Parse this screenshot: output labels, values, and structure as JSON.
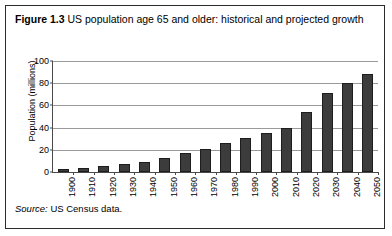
{
  "figure": {
    "label": "Figure 1.3",
    "title": "US population age 65 and older: historical and projected growth",
    "source_word": "Source:",
    "source_text": "US Census data."
  },
  "chart_data": {
    "type": "bar",
    "title": "US population age 65 and older: historical and projected growth",
    "xlabel": "",
    "ylabel": "Population (millions)",
    "ylim": [
      0,
      100
    ],
    "yticks": [
      0,
      20,
      40,
      60,
      80,
      100
    ],
    "grid": true,
    "legend": false,
    "bar_color": "#3c3c3c",
    "categories": [
      "1900",
      "1910",
      "1920",
      "1930",
      "1940",
      "1950",
      "1960",
      "1970",
      "1980",
      "1990",
      "2000",
      "2010",
      "2020",
      "2030",
      "2040",
      "2050"
    ],
    "values": [
      3,
      4,
      5,
      7,
      9,
      12.5,
      17,
      20.5,
      26,
      31,
      35,
      40,
      54.5,
      71.5,
      80.5,
      88
    ]
  }
}
